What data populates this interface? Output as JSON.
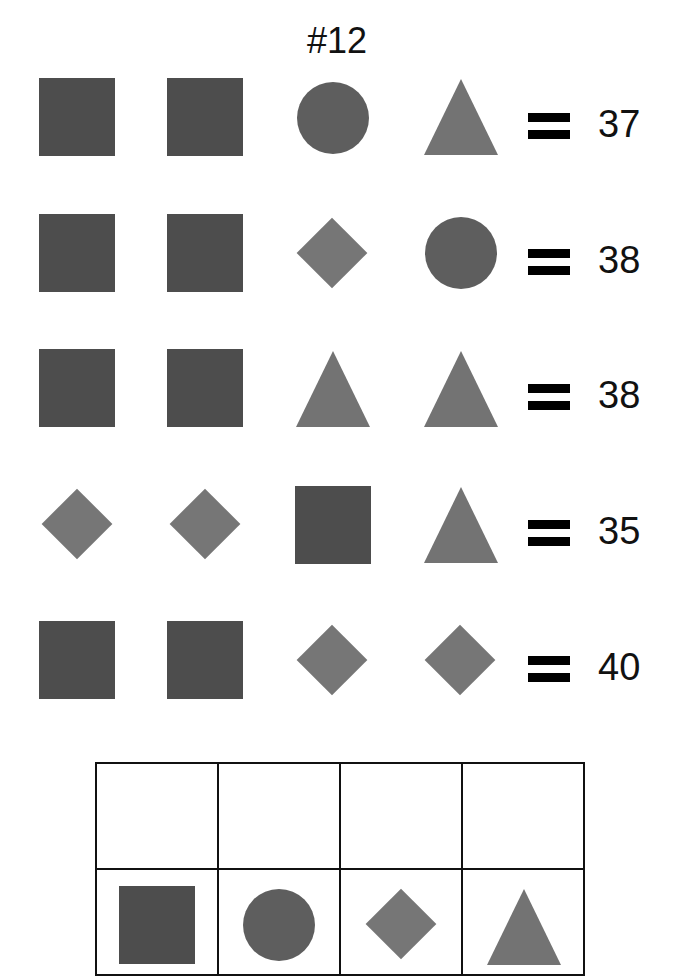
{
  "title": "#12",
  "rows": [
    {
      "shapes": [
        "square",
        "square",
        "circle",
        "triangle"
      ],
      "equals": "=",
      "value": "37"
    },
    {
      "shapes": [
        "square",
        "square",
        "diamond",
        "circle"
      ],
      "equals": "=",
      "value": "38"
    },
    {
      "shapes": [
        "square",
        "square",
        "triangle",
        "triangle"
      ],
      "equals": "=",
      "value": "38"
    },
    {
      "shapes": [
        "diamond",
        "diamond",
        "square",
        "triangle"
      ],
      "equals": "=",
      "value": "35"
    },
    {
      "shapes": [
        "square",
        "square",
        "diamond",
        "diamond"
      ],
      "equals": "=",
      "value": "40"
    }
  ],
  "answer_table": {
    "answers": [
      "",
      "",
      "",
      ""
    ],
    "shapes": [
      "square",
      "circle",
      "diamond",
      "triangle"
    ]
  },
  "colors": {
    "square": "#4d4d4d",
    "circle": "#5e5e5e",
    "diamond": "#767676",
    "triangle": "#737373"
  }
}
